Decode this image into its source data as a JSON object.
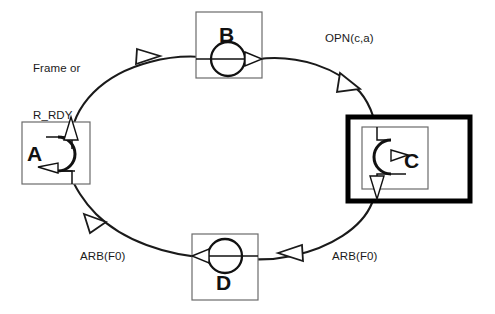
{
  "diagram": {
    "type": "ring-state-diagram",
    "canvas": {
      "width": 495,
      "height": 314,
      "background": "#ffffff"
    },
    "colors": {
      "line": "#1a1a1a",
      "text": "#111111",
      "highlight_border": "#000000",
      "node_border": "#6b6b6b",
      "fill": "#ffffff"
    },
    "nodes": [
      {
        "id": "node-a",
        "label": "A",
        "position": "left",
        "highlighted": false,
        "glyph": "arc-right-bulge-with-left-arrow-and-up-exit"
      },
      {
        "id": "node-b",
        "label": "B",
        "position": "top",
        "highlighted": false,
        "glyph": "circle-with-pass-through-right-arrow"
      },
      {
        "id": "node-c",
        "label": "C",
        "position": "right",
        "highlighted": true,
        "glyph": "arc-left-bulge-with-right-arrow-and-down-exit"
      },
      {
        "id": "node-d",
        "label": "D",
        "position": "bottom",
        "highlighted": false,
        "glyph": "circle-with-pass-through-left-arrow"
      }
    ],
    "edges": [
      {
        "id": "edge-a-to-b",
        "from": "A",
        "to": "B",
        "label": "Frame or\nR_RDY",
        "label_line1": "Frame or",
        "label_line2": "R_RDY",
        "direction": "clockwise",
        "arrow": "hollow"
      },
      {
        "id": "edge-b-to-c",
        "from": "B",
        "to": "C",
        "label": "OPN(c,a)",
        "direction": "clockwise",
        "arrow": "hollow"
      },
      {
        "id": "edge-c-to-d",
        "from": "C",
        "to": "D",
        "label": "ARB(F0)",
        "direction": "clockwise",
        "arrow": "hollow"
      },
      {
        "id": "edge-d-to-a",
        "from": "D",
        "to": "A",
        "label": "ARB(F0)",
        "direction": "clockwise",
        "arrow": "hollow"
      }
    ],
    "labels": {
      "top_left_line1": "Frame or",
      "top_left_line2": "R_RDY",
      "top_right": "OPN(c,a)",
      "bottom_left": "ARB(F0)",
      "bottom_right": "ARB(F0)"
    }
  }
}
